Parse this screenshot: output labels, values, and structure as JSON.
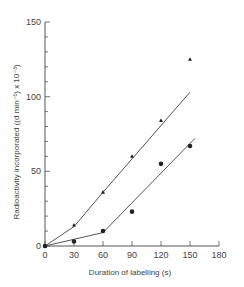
{
  "chart_data": {
    "type": "scatter",
    "title": "",
    "xlabel": "Duration of labelling (s)",
    "ylabel": "Radioactivity incorporated ((d min⁻¹) x 10⁻³)",
    "xlim": [
      0,
      180
    ],
    "ylim": [
      0,
      150
    ],
    "x_ticks": [
      "0",
      "30",
      "60",
      "90",
      "120",
      "150",
      "180"
    ],
    "y_ticks": [
      "0",
      "50",
      "100",
      "150"
    ],
    "grid": false,
    "series": [
      {
        "name": "triangles",
        "marker": "triangle",
        "x": [
          0,
          30,
          60,
          90,
          120,
          150
        ],
        "y": [
          0,
          14,
          36,
          60,
          84,
          125
        ],
        "fit_line": [
          [
            0,
            0
          ],
          [
            30,
            13
          ],
          [
            60,
            36
          ],
          [
            150,
            103
          ]
        ]
      },
      {
        "name": "circles",
        "marker": "circle",
        "x": [
          0,
          30,
          60,
          90,
          120,
          150
        ],
        "y": [
          0,
          3,
          10,
          23,
          55,
          67
        ],
        "fit_line": [
          [
            0,
            0
          ],
          [
            60,
            9
          ],
          [
            155,
            72
          ]
        ]
      }
    ]
  }
}
